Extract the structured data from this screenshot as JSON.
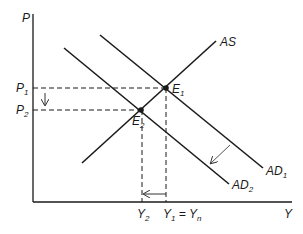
{
  "diagram": {
    "type": "AD-AS shift",
    "axes": {
      "y_label": "P",
      "x_label": "Y"
    },
    "curves": [
      {
        "name": "AS",
        "label": "AS",
        "subscript": ""
      },
      {
        "name": "AD1",
        "label": "AD",
        "subscript": "1"
      },
      {
        "name": "AD2",
        "label": "AD",
        "subscript": "2"
      }
    ],
    "points": [
      {
        "name": "E1",
        "label": "E",
        "subscript": "1"
      },
      {
        "name": "E2",
        "label": "E",
        "subscript": "2"
      }
    ],
    "price_levels": [
      {
        "label": "P",
        "subscript": "1"
      },
      {
        "label": "P",
        "subscript": "2"
      }
    ],
    "output_levels": [
      {
        "label": "Y",
        "subscript": "2",
        "suffix": ""
      },
      {
        "label": "Y",
        "subscript": "1",
        "suffix": " = Y",
        "suffix_subscript": "n"
      }
    ],
    "colors": {
      "line": "#1a1a1a",
      "arrow": "#555555"
    }
  }
}
